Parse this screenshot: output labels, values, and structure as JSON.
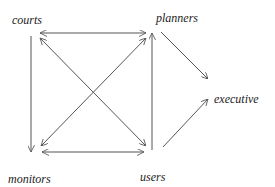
{
  "diagram": {
    "type": "directed-graph",
    "colors": {
      "line": "#555555",
      "text": "#222222",
      "background": "#ffffff"
    },
    "nodes": [
      {
        "id": "courts",
        "label": "courts",
        "x": 12,
        "y": 24
      },
      {
        "id": "planners",
        "label": "planners",
        "x": 156,
        "y": 22
      },
      {
        "id": "executive",
        "label": "executive",
        "x": 214,
        "y": 103
      },
      {
        "id": "monitors",
        "label": "monitors",
        "x": 8,
        "y": 183
      },
      {
        "id": "users",
        "label": "users",
        "x": 140,
        "y": 181
      }
    ],
    "edges": [
      {
        "from": "courts",
        "to": "planners",
        "bidirectional": true
      },
      {
        "from": "monitors",
        "to": "users",
        "bidirectional": true
      },
      {
        "from": "courts",
        "to": "monitors",
        "bidirectional": false
      },
      {
        "from": "users",
        "to": "planners",
        "bidirectional": false
      },
      {
        "from": "courts",
        "to": "users",
        "bidirectional": true
      },
      {
        "from": "planners",
        "to": "monitors",
        "bidirectional": true
      },
      {
        "from": "planners",
        "to": "executive",
        "bidirectional": false
      },
      {
        "from": "users",
        "to": "executive",
        "bidirectional": false
      }
    ]
  }
}
